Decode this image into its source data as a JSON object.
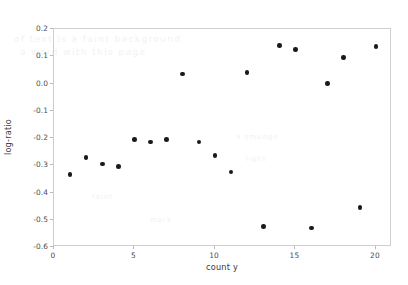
{
  "chart_data": {
    "type": "scatter",
    "title": "",
    "xlabel": "count y",
    "ylabel": "log-ratio",
    "xlim": [
      0,
      21
    ],
    "ylim": [
      -0.6,
      0.2
    ],
    "grid": false,
    "legend": null,
    "xticks": [
      0,
      5,
      10,
      15,
      20
    ],
    "xtick_labels": [
      "0",
      "5",
      "10",
      "15",
      "20"
    ],
    "yticks": [
      0.2,
      0.1,
      0.0,
      -0.1,
      -0.2,
      -0.3,
      -0.4,
      -0.5,
      -0.6
    ],
    "ytick_labels": [
      "0.2",
      "0.1",
      "0.0",
      "-0.1",
      "-0.2",
      "-0.3",
      "-0.4",
      "-0.5",
      "-0.6"
    ],
    "marker": "circle",
    "marker_color": "#1a1a1a",
    "x": [
      1,
      2,
      3,
      4,
      5,
      6,
      7,
      8,
      9,
      10,
      11,
      12,
      13,
      14,
      15,
      16,
      17,
      18,
      19,
      20
    ],
    "y": [
      -0.335,
      -0.272,
      -0.295,
      -0.305,
      -0.205,
      -0.215,
      -0.205,
      0.035,
      -0.215,
      -0.265,
      -0.325,
      0.04,
      -0.525,
      0.14,
      0.125,
      -0.53,
      0.0,
      0.095,
      -0.455,
      0.135
    ],
    "points": [
      {
        "x": 1,
        "y": -0.335
      },
      {
        "x": 2,
        "y": -0.272
      },
      {
        "x": 3,
        "y": -0.295
      },
      {
        "x": 4,
        "y": -0.305
      },
      {
        "x": 5,
        "y": -0.205
      },
      {
        "x": 6,
        "y": -0.215
      },
      {
        "x": 7,
        "y": -0.205
      },
      {
        "x": 8,
        "y": 0.035
      },
      {
        "x": 9,
        "y": -0.215
      },
      {
        "x": 10,
        "y": -0.265
      },
      {
        "x": 11,
        "y": -0.325
      },
      {
        "x": 12,
        "y": 0.04
      },
      {
        "x": 13,
        "y": -0.525
      },
      {
        "x": 14,
        "y": 0.14
      },
      {
        "x": 15,
        "y": 0.125
      },
      {
        "x": 16,
        "y": -0.53
      },
      {
        "x": 17,
        "y": 0.0
      },
      {
        "x": 18,
        "y": 0.095
      },
      {
        "x": 19,
        "y": -0.455
      },
      {
        "x": 20,
        "y": 0.135
      }
    ]
  },
  "axes": {
    "xlabel": "count y",
    "ylabel": "log-ratio"
  },
  "watermark": {
    "line1": "of text is a faint background",
    "line2": "a word with this page",
    "line3": "a smudge",
    "line4": "light",
    "line5": "faint",
    "line6": "mark"
  }
}
